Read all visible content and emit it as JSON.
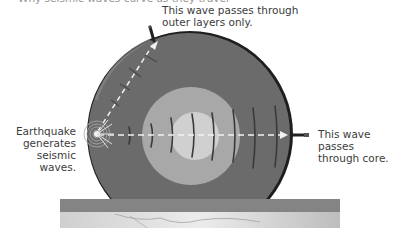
{
  "diagram": {
    "title_clipped": "Why seismic waves curve as they travel",
    "labels": {
      "top": [
        "This wave passes through",
        "outer layers only."
      ],
      "left": [
        "Earthquake",
        "generates",
        "seismic waves."
      ],
      "right": [
        "This wave passes",
        "through core."
      ]
    },
    "layers": [
      {
        "name": "mantle",
        "color": "#6b6b6b"
      },
      {
        "name": "outer-core",
        "color": "#a8a8a8"
      },
      {
        "name": "inner-core",
        "color": "#d0d0d0"
      },
      {
        "name": "crust",
        "color": "#858585"
      },
      {
        "name": "surface",
        "color": "#dedede"
      }
    ],
    "colors": {
      "wave_path": "#ffffff",
      "wavefront": "#3a3a3a",
      "globe_rim": "#1a1a1a",
      "seismograph": "#222222"
    }
  }
}
